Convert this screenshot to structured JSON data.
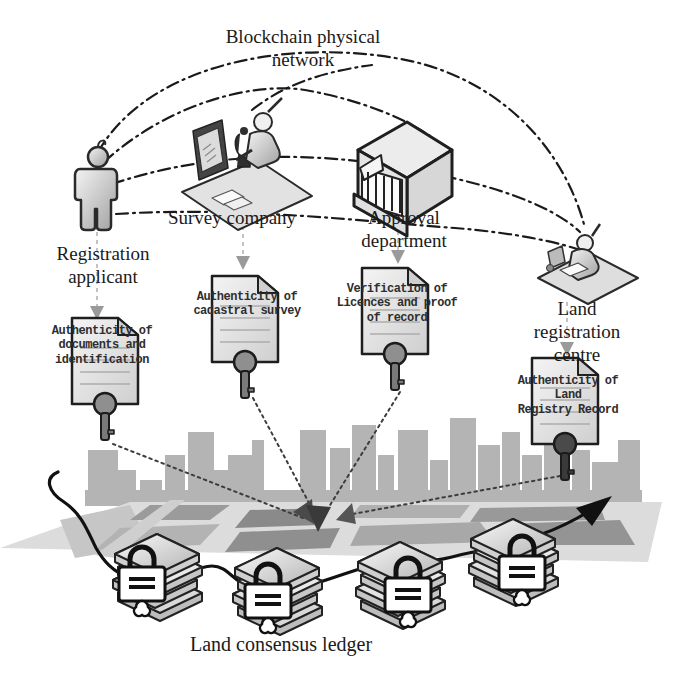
{
  "diagram": {
    "title": "Blockchain physical\nnetwork",
    "actors": {
      "applicant": {
        "label": "Registration\napplicant",
        "icon": "person-icon"
      },
      "survey": {
        "label": "Survey company",
        "icon": "surveyor-desk-icon"
      },
      "approval": {
        "label": "Approval\ndepartment",
        "icon": "government-building-icon"
      },
      "registry": {
        "label": "Land registration centre",
        "icon": "registrar-desk-icon"
      }
    },
    "documents": {
      "d1": {
        "label": "Authenticity of\ndocuments and\nidentification",
        "icon": "document-key-icon"
      },
      "d2": {
        "label": "Authenticity of\ncadastral survey",
        "icon": "document-key-icon"
      },
      "d3": {
        "label": "Verification of\nLicences and proof\nof record",
        "icon": "document-key-icon"
      },
      "d4": {
        "label": "Authenticity of Land\nRegistry Record",
        "icon": "document-key-icon"
      }
    },
    "ledger": {
      "label": "Land consensus ledger",
      "icon": "ledger-stack-lock-icon"
    },
    "colors": {
      "network_line": "#1a1a1a",
      "muted_arrow": "#9a9a9a",
      "skyline": "#b4b4b4",
      "page_fill": "#e9e9e9",
      "key": "#8f8f8f",
      "key_dark": "#4a4a4a",
      "lock_fill": "#ffffff",
      "chain_line": "#111111"
    }
  }
}
